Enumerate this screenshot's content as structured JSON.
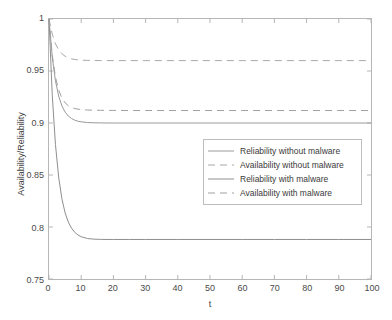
{
  "chart_data": {
    "type": "line",
    "title": "",
    "xlabel": "t",
    "ylabel": "Availability/Reliability",
    "xlim": [
      0,
      100
    ],
    "ylim": [
      0.75,
      1.0
    ],
    "grid": false,
    "legend_position": "center-right",
    "xticks": [
      0,
      10,
      20,
      30,
      40,
      50,
      60,
      70,
      80,
      90,
      100
    ],
    "xtick_labels": [
      "0",
      "10",
      "20",
      "30",
      "40",
      "50",
      "60",
      "70",
      "80",
      "90",
      "100"
    ],
    "yticks": [
      0.75,
      0.8,
      0.85,
      0.9,
      0.95,
      1
    ],
    "ytick_labels": [
      "0.75",
      "0.8",
      "0.85",
      "0.9",
      "0.95",
      "1"
    ],
    "series": [
      {
        "name": "Reliability without malware",
        "style": "solid",
        "color": "#9a9a9a",
        "initial": 1.0,
        "plateau": 0.9,
        "decay_rate": 0.45,
        "x": [
          0,
          1,
          2,
          3,
          4,
          5,
          6,
          7,
          8,
          9,
          10,
          12,
          14,
          16,
          18,
          20,
          25,
          30,
          40,
          50,
          60,
          70,
          80,
          90,
          100
        ],
        "y": [
          1.0,
          0.9637,
          0.9406,
          0.9259,
          0.9165,
          0.9105,
          0.9067,
          0.9043,
          0.9027,
          0.9017,
          0.9011,
          0.9004,
          0.9002,
          0.9001,
          0.9,
          0.9,
          0.9,
          0.9,
          0.9,
          0.9,
          0.9,
          0.9,
          0.9,
          0.9,
          0.9
        ]
      },
      {
        "name": "Availability without malware",
        "style": "dashed",
        "color": "#a8a8a8",
        "initial": 1.0,
        "plateau": 0.96,
        "decay_rate": 0.45,
        "x": [
          0,
          1,
          2,
          3,
          4,
          5,
          6,
          7,
          8,
          9,
          10,
          12,
          14,
          16,
          18,
          20,
          25,
          30,
          40,
          50,
          60,
          70,
          80,
          90,
          100
        ],
        "y": [
          1.0,
          0.9855,
          0.9762,
          0.9704,
          0.9666,
          0.9642,
          0.9627,
          0.9617,
          0.9611,
          0.9607,
          0.9604,
          0.9602,
          0.9601,
          0.96,
          0.96,
          0.96,
          0.96,
          0.96,
          0.96,
          0.96,
          0.96,
          0.96,
          0.96,
          0.96,
          0.96
        ]
      },
      {
        "name": "Reliability with malware",
        "style": "solid",
        "color": "#8f8f8f",
        "initial": 1.0,
        "plateau": 0.788,
        "decay_rate": 0.42,
        "x": [
          0,
          1,
          2,
          3,
          4,
          5,
          6,
          7,
          8,
          9,
          10,
          12,
          14,
          16,
          18,
          20,
          25,
          30,
          40,
          50,
          60,
          70,
          80,
          90,
          100
        ],
        "y": [
          1.0,
          0.9272,
          0.8794,
          0.8479,
          0.8272,
          0.8136,
          0.8047,
          0.7988,
          0.7949,
          0.7923,
          0.7906,
          0.7889,
          0.7883,
          0.7881,
          0.788,
          0.788,
          0.788,
          0.788,
          0.788,
          0.788,
          0.788,
          0.788,
          0.788,
          0.788,
          0.788
        ]
      },
      {
        "name": "Availability with malware",
        "style": "dashed",
        "color": "#a0a0a0",
        "initial": 1.0,
        "plateau": 0.91,
        "decay_rate": 0.5,
        "x": [
          0,
          1,
          2,
          3,
          4,
          5,
          6,
          7,
          8,
          9,
          10,
          12,
          14,
          16,
          18,
          20,
          25,
          30,
          40,
          50,
          60,
          70,
          80,
          90,
          100
        ],
        "y": [
          1.0,
          0.9654,
          0.9444,
          0.9317,
          0.924,
          0.9194,
          0.9166,
          0.9149,
          0.9139,
          0.9133,
          0.9129,
          0.9125,
          0.9123,
          0.9122,
          0.9121,
          0.9121,
          0.912,
          0.912,
          0.912,
          0.912,
          0.912,
          0.912,
          0.912,
          0.912,
          0.912
        ]
      }
    ]
  },
  "legend": {
    "items": [
      {
        "label": "Reliability without malware"
      },
      {
        "label": "Availability without malware"
      },
      {
        "label": "Reliability with malware"
      },
      {
        "label": "Availability with malware"
      }
    ]
  }
}
